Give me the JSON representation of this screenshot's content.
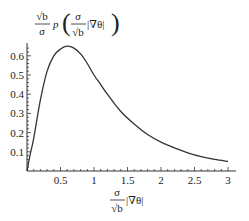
{
  "chart_data": {
    "type": "line",
    "title": "",
    "ylabel": "√b/σ p(σ/√b |∇θ|)",
    "xlabel": "σ/√b |∇θ|",
    "ylabel_parts": {
      "num": "√b",
      "den": "σ",
      "func": "p",
      "arg_num": "σ",
      "arg_den": "√b",
      "arg_tail": "|∇θ|"
    },
    "xlabel_parts": {
      "num": "σ",
      "den": "√b",
      "tail": "|∇θ|"
    },
    "xlim": [
      0,
      3
    ],
    "ylim": [
      0,
      0.66
    ],
    "x_ticks": [
      0.5,
      1,
      1.5,
      2,
      2.5,
      3
    ],
    "x_tick_labels": [
      "0.5",
      "1",
      "1.5",
      "2",
      "2.5",
      "3"
    ],
    "y_ticks": [
      0.1,
      0.2,
      0.3,
      0.4,
      0.5,
      0.6
    ],
    "y_tick_labels": [
      "0.1",
      "0.2",
      "0.3",
      "0.4",
      "0.5",
      "0.6"
    ],
    "grid": false,
    "legend": null,
    "series": [
      {
        "name": "p",
        "color": "#333333",
        "x": [
          0,
          0.05,
          0.1,
          0.2,
          0.3,
          0.4,
          0.5,
          0.6,
          0.7,
          0.8,
          0.9,
          1.0,
          1.1,
          1.2,
          1.4,
          1.6,
          1.8,
          2.0,
          2.2,
          2.4,
          2.6,
          2.8,
          3.0
        ],
        "y": [
          0,
          0.09,
          0.17,
          0.37,
          0.52,
          0.6,
          0.635,
          0.65,
          0.64,
          0.61,
          0.56,
          0.5,
          0.45,
          0.4,
          0.31,
          0.245,
          0.19,
          0.15,
          0.12,
          0.095,
          0.075,
          0.06,
          0.05
        ]
      }
    ]
  }
}
